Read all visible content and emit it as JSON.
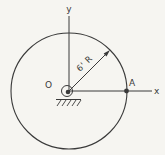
{
  "figure": {
    "labels": {
      "y_axis": "y",
      "x_axis": "x",
      "origin": "O",
      "rim_point": "A",
      "radius": "6' R"
    },
    "colors": {
      "line": "#3a3a3a",
      "background": "#f6f5f1"
    },
    "geometry": {
      "center_px": {
        "x": 69,
        "y": 91
      },
      "circle_radius_px": 58,
      "radius_arrow_angle_deg": 45
    }
  }
}
